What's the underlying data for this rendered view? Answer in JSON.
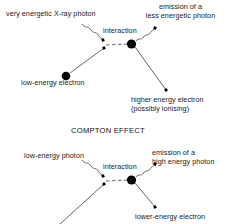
{
  "figure": {
    "kind": "physics-interaction-diagram",
    "stroke_color": "#555555",
    "dot_color": "#000000",
    "text_color": "#1a1a1a"
  },
  "section_title": "COMPTON EFFECT",
  "diagram_top": {
    "name": "x-ray-electron-interaction",
    "labels": {
      "incoming_photon": "very energetic X-ray photon",
      "interaction": "interaction",
      "emitted_photon_line1": "emission of a",
      "emitted_photon_line2": "less energetic photon",
      "incoming_electron": "low-energy electron",
      "outgoing_electron_line1": "higher energy electron",
      "outgoing_electron_line2": "(possibly ionising)"
    }
  },
  "diagram_bottom": {
    "name": "compton-effect-interaction",
    "labels": {
      "incoming_photon": "low-energy photon",
      "interaction": "interaction",
      "emitted_photon_line1": "emission of a",
      "emitted_photon_line2": "high energy photon",
      "outgoing_electron": "lower-energy electron"
    }
  }
}
